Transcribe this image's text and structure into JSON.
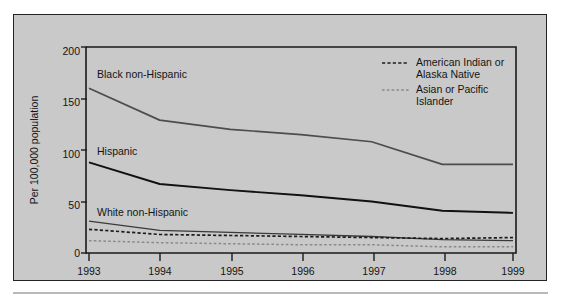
{
  "chart_data": {
    "type": "line",
    "title": "",
    "xlabel": "",
    "ylabel": "Per 100,000 population",
    "x": [
      1993,
      1994,
      1995,
      1996,
      1997,
      1998,
      1999
    ],
    "xtick_labels": [
      "1993",
      "1994",
      "1995",
      "1996",
      "1997",
      "1998",
      "1999"
    ],
    "ytick_labels": [
      "0",
      "50",
      "100",
      "150",
      "200"
    ],
    "yticks": [
      0,
      50,
      100,
      150,
      200
    ],
    "ylim": [
      0,
      200
    ],
    "xlim": [
      1993,
      1999
    ],
    "grid": false,
    "legend_position": "top-right-inside",
    "series": [
      {
        "name": "Black non-Hispanic",
        "label_kind": "inline",
        "style": "solid",
        "color": "#4d4d4d",
        "values": [
          160,
          129,
          120,
          115,
          108,
          86,
          86
        ]
      },
      {
        "name": "Hispanic",
        "label_kind": "inline",
        "style": "solid",
        "color": "#111111",
        "values": [
          88,
          67,
          61,
          56,
          50,
          41,
          39
        ]
      },
      {
        "name": "White non-Hispanic",
        "label_kind": "inline",
        "style": "solid",
        "color": "#3a3a3a",
        "values": [
          31,
          22,
          20,
          18,
          16,
          13,
          12
        ]
      },
      {
        "name": "American Indian or Alaska Native",
        "label_kind": "legend",
        "style": "dashed",
        "color": "#1c1c1c",
        "values": [
          23,
          18,
          17,
          16,
          15,
          14,
          15
        ]
      },
      {
        "name": "Asian or Pacific Islander",
        "label_kind": "legend",
        "style": "dotted",
        "color": "#8a8a8a",
        "values": [
          12,
          10,
          9,
          8,
          8,
          6,
          6
        ]
      }
    ],
    "inline_labels": [
      {
        "text": "Black non-Hispanic",
        "x": 97,
        "y": 78
      },
      {
        "text": "Hispanic",
        "x": 97,
        "y": 155
      },
      {
        "text": "White non-Hispanic",
        "x": 97,
        "y": 216
      }
    ],
    "legend_entries": [
      {
        "line1": "American Indian or",
        "line2": "Alaska Native",
        "style": "dashed",
        "color": "#1c1c1c"
      },
      {
        "line1": "Asian or Pacific",
        "line2": "Islander",
        "style": "dotted",
        "color": "#8a8a8a"
      }
    ]
  }
}
